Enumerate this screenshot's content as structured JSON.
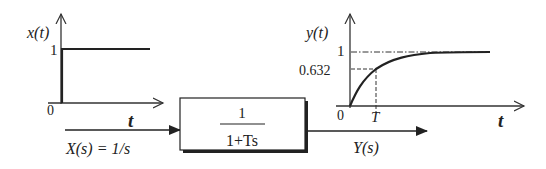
{
  "input_plot": {
    "ylabel": "x(t)",
    "xlabel": "t",
    "origin_label": "0",
    "level_label": "1"
  },
  "input_signal": {
    "arrow_label": "X(s) = 1/s"
  },
  "block": {
    "numerator": "1",
    "denominator": "1+Ts"
  },
  "output_signal": {
    "arrow_label": "Y(s)"
  },
  "output_plot": {
    "ylabel": "y(t)",
    "xlabel": "t",
    "origin_label": "0",
    "final_value_label": "1",
    "tau_value_label": "0.632",
    "time_constant_label": "T"
  },
  "colors": {
    "ink": "#222222",
    "background": "#ffffff"
  }
}
